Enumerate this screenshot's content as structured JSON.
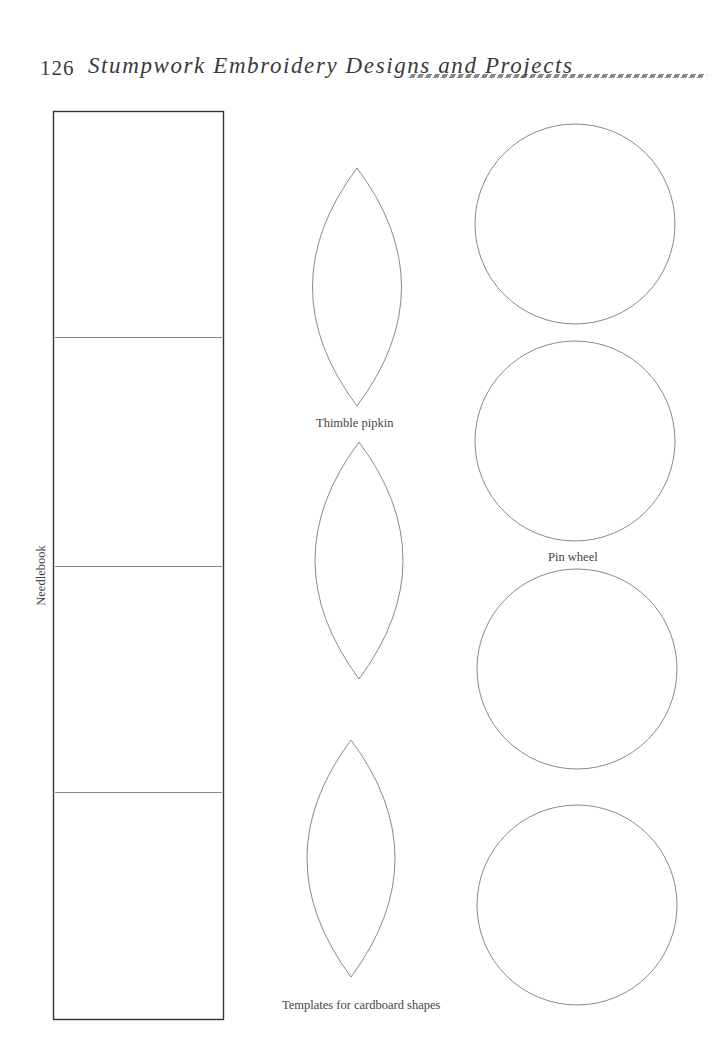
{
  "header": {
    "page_number": "126",
    "title": "Stumpwork Embroidery Designs and Projects"
  },
  "labels": {
    "needlebook": "Needlebook",
    "thimble_pipkin": "Thimble pipkin",
    "pin_wheel": "Pin wheel",
    "templates": "Templates for cardboard shapes"
  },
  "colors": {
    "outline": "#8a8a8a",
    "rectangle_border": "#333333",
    "text": "#444444"
  },
  "needlebook": {
    "sections": 4
  },
  "thimble_pipkin_shapes": 3,
  "pin_wheel_circles": 4
}
